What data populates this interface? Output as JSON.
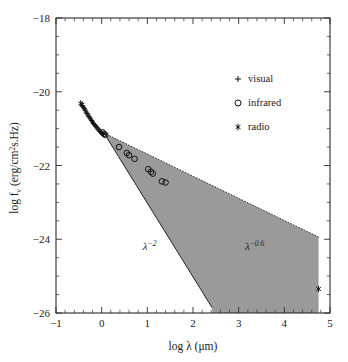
{
  "figure": {
    "background_color": "#ffffff",
    "wedge_color": "#9a9a9a",
    "ink_color": "#1a1a1a"
  },
  "axes": {
    "x": {
      "label_prefix": "log ",
      "label_symbol": "λ",
      "label_unit": " (μm)",
      "label_full": "log λ (μm)",
      "min": -1,
      "max": 5,
      "ticks": [
        -1,
        0,
        1,
        2,
        3,
        4,
        5
      ],
      "ticklabels": [
        "−1",
        "0",
        "1",
        "2",
        "3",
        "4",
        "5"
      ],
      "minor_per_interval": 5
    },
    "y": {
      "label_full": "log fν (erg/cm²s.Hz)",
      "label_part1": "log f",
      "label_sub": "ν",
      "label_part2": " (erg/cm",
      "label_sup": "2",
      "label_part3": "s.Hz)",
      "min": -26,
      "max": -18,
      "ticks": [
        -18,
        -20,
        -22,
        -24,
        -26
      ],
      "ticklabels": [
        "−18",
        "−20",
        "−22",
        "−24",
        "−26"
      ],
      "minor_per_interval": 4
    }
  },
  "legend": {
    "position": "upper-right",
    "items": [
      {
        "marker": "plus",
        "label": "visual"
      },
      {
        "marker": "circle",
        "label": "infrared"
      },
      {
        "marker": "star",
        "label": "radio"
      }
    ]
  },
  "annotations": [
    {
      "name": "lambda-minus-2",
      "base": "λ",
      "exponent": "−2",
      "x": 1.05,
      "y": -24.3
    },
    {
      "name": "lambda-minus-0p6",
      "base": "λ",
      "exponent": "−0.6",
      "x": 3.35,
      "y": -24.3
    }
  ],
  "chart_data": {
    "type": "scatter",
    "title": "",
    "xlabel": "log λ (μm)",
    "ylabel": "log fν (erg/cm²s.Hz)",
    "xlim": [
      -1,
      5
    ],
    "ylim": [
      -26,
      -18
    ],
    "grid": false,
    "legend_position": "upper right",
    "series": [
      {
        "name": "visual",
        "marker": "plus",
        "points": [
          [
            -0.42,
            -20.38
          ],
          [
            -0.4,
            -20.42
          ],
          [
            -0.38,
            -20.46
          ],
          [
            -0.36,
            -20.5
          ],
          [
            -0.34,
            -20.55
          ],
          [
            -0.32,
            -20.59
          ],
          [
            -0.3,
            -20.63
          ],
          [
            -0.28,
            -20.67
          ],
          [
            -0.26,
            -20.71
          ],
          [
            -0.24,
            -20.74
          ],
          [
            -0.22,
            -20.78
          ],
          [
            -0.2,
            -20.82
          ],
          [
            -0.18,
            -20.86
          ],
          [
            -0.16,
            -20.89
          ],
          [
            -0.14,
            -20.92
          ],
          [
            -0.12,
            -20.95
          ],
          [
            -0.1,
            -20.98
          ],
          [
            -0.08,
            -21.01
          ],
          [
            -0.06,
            -21.04
          ],
          [
            -0.04,
            -21.07
          ],
          [
            -0.02,
            -21.09
          ],
          [
            0.0,
            -21.12
          ],
          [
            0.02,
            -21.14
          ],
          [
            0.04,
            -21.16
          ]
        ]
      },
      {
        "name": "infrared",
        "marker": "circle",
        "points": [
          [
            0.02,
            -21.1
          ],
          [
            0.05,
            -21.14
          ],
          [
            0.08,
            -21.17
          ],
          [
            0.38,
            -21.5
          ],
          [
            0.55,
            -21.66
          ],
          [
            0.6,
            -21.72
          ],
          [
            0.72,
            -21.82
          ],
          [
            1.02,
            -22.1
          ],
          [
            1.08,
            -22.17
          ],
          [
            1.12,
            -22.22
          ],
          [
            1.32,
            -22.43
          ],
          [
            1.4,
            -22.46
          ]
        ]
      },
      {
        "name": "radio",
        "marker": "star",
        "points": [
          [
            -0.46,
            -20.32
          ],
          [
            -0.43,
            -20.35
          ],
          [
            4.75,
            -25.35
          ]
        ]
      }
    ],
    "shaded_region": {
      "name": "spectral-index-wedge",
      "description": "Shaded wedge between lambda^-2 and lambda^-0.6 power laws",
      "color": "#9a9a9a",
      "apex": [
        0.05,
        -21.12
      ],
      "lower_bound_exponent": -2.0,
      "lower_bound_end": [
        2.42,
        -26.0
      ],
      "upper_bound_exponent": -0.6,
      "upper_bound_end": [
        4.75,
        -25.35
      ]
    }
  }
}
